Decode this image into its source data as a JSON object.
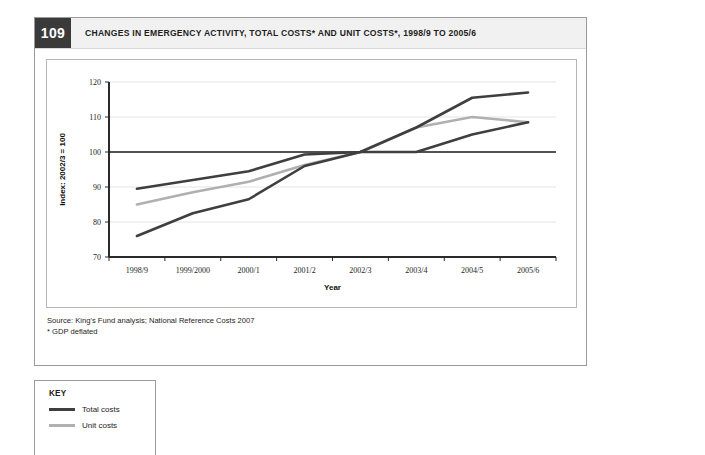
{
  "figure": {
    "number": "109",
    "title": "CHANGES IN EMERGENCY ACTIVITY, TOTAL COSTS* AND UNIT COSTS*, 1998/9 TO 2005/6",
    "source_line": "Source: King's Fund analysis; National Reference Costs 2007",
    "footnote_line": "* GDP deflated"
  },
  "key": {
    "title": "KEY",
    "items": [
      {
        "label": "Total costs",
        "color": "#3f3f3f"
      },
      {
        "label": "Unit costs",
        "color": "#b0b0b0"
      }
    ]
  },
  "chart_data": {
    "type": "line",
    "title": "CHANGES IN EMERGENCY ACTIVITY, TOTAL COSTS* AND UNIT COSTS*, 1998/9 TO 2005/6",
    "xlabel": "Year",
    "ylabel": "Index: 2002/3 = 100",
    "categories": [
      "1998/9",
      "1999/2000",
      "2000/1",
      "2001/2",
      "2002/3",
      "2003/4",
      "2004/5",
      "2005/6"
    ],
    "ylim": [
      70,
      120
    ],
    "yticks": [
      70,
      80,
      90,
      100,
      110,
      120
    ],
    "grid": true,
    "reference_line": 100,
    "legend_position": "below-left",
    "series": [
      {
        "name": "Total costs",
        "color": "#3f3f3f",
        "values": [
          89.5,
          92.0,
          94.5,
          99.3,
          100.0,
          107.0,
          115.5,
          117.0
        ]
      },
      {
        "name": "Unit costs",
        "color": "#b0b0b0",
        "values": [
          85.0,
          88.5,
          91.5,
          96.3,
          100.0,
          107.0,
          110.0,
          108.5
        ]
      },
      {
        "name": "Emergency activity",
        "color": "#3f3f3f",
        "values": [
          76.0,
          82.5,
          86.5,
          96.0,
          100.0,
          100.0,
          105.0,
          108.5
        ]
      }
    ]
  }
}
